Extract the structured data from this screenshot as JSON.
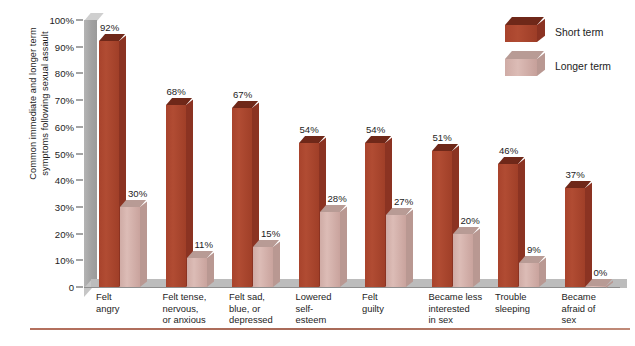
{
  "chart_data": {
    "type": "bar",
    "title": "",
    "xlabel": "",
    "ylabel": "Common immediate and longer term\nsymptoms following sexual assault",
    "ylim": [
      0,
      100
    ],
    "ytick_labels": [
      "100%",
      "90%",
      "80%",
      "70%",
      "60%",
      "50%",
      "40%",
      "30%",
      "20%",
      "10%",
      "0"
    ],
    "ytick_values": [
      100,
      90,
      80,
      70,
      60,
      50,
      40,
      30,
      20,
      10,
      0
    ],
    "grid": false,
    "legend_position": "top-right",
    "categories": [
      "Felt\nangry",
      "Felt tense,\nnervous,\nor anxious",
      "Felt sad,\nblue, or\ndepressed",
      "Lowered\nself-\nesteem",
      "Felt\nguilty",
      "Became less\ninterested\nin sex",
      "Trouble\nsleeping",
      "Became\nafraid of\nsex"
    ],
    "series": [
      {
        "name": "Short term",
        "color": "#a8432c",
        "values": [
          92,
          68,
          67,
          54,
          54,
          51,
          46,
          37
        ],
        "labels": [
          "92%",
          "68%",
          "67%",
          "54%",
          "54%",
          "51%",
          "46%",
          "37%"
        ]
      },
      {
        "name": "Longer term",
        "color": "#d3b2ac",
        "values": [
          30,
          11,
          15,
          28,
          27,
          20,
          9,
          0
        ],
        "labels": [
          "30%",
          "11%",
          "15%",
          "28%",
          "27%",
          "20%",
          "9%",
          "0%"
        ]
      }
    ]
  },
  "legend": {
    "items": [
      {
        "label": "Short term",
        "swatch": "short-term-swatch"
      },
      {
        "label": "Longer term",
        "swatch": "longer-term-swatch"
      }
    ]
  },
  "colors": {
    "short_term": "#a8432c",
    "longer_term": "#d3b2ac",
    "axis_wall": "#a2a2a2",
    "floor": "#bcbcbc",
    "bottom_rule": "#b4705e",
    "text": "#1d1d1d",
    "background": "#ffffff"
  }
}
